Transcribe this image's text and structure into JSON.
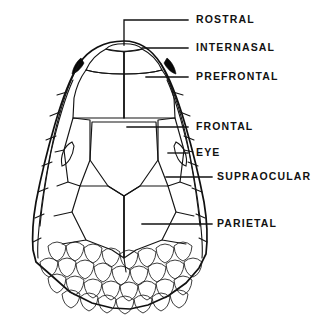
{
  "figure": {
    "name": "snake-head-dorsal-scalation-diagram",
    "background_color": "#ffffff",
    "ink_color": "#121212",
    "view": "dorsal"
  },
  "labels": [
    {
      "id": "rostral",
      "text": "ROSTRAL",
      "text_x": 196,
      "text_y": 20,
      "leader": "M 188 20 L 124 20 L 124 45",
      "points_to": "snout tip shield"
    },
    {
      "id": "internasal",
      "text": "INTERNASAL",
      "text_x": 196,
      "text_y": 48,
      "leader": "M 188 48 L 142 48",
      "points_to": "paired shields behind rostral"
    },
    {
      "id": "prefrontal",
      "text": "PREFRONTAL",
      "text_x": 196,
      "text_y": 77,
      "leader": "M 188 77 L 146 77",
      "points_to": "paired shields behind internasals"
    },
    {
      "id": "frontal",
      "text": "FRONTAL",
      "text_x": 196,
      "text_y": 127,
      "leader": "M 188 127 L 127 127",
      "points_to": "large median shield on crown"
    },
    {
      "id": "eye",
      "text": "EYE",
      "text_x": 196,
      "text_y": 153,
      "leader": "M 188 153 L 168 153",
      "points_to": "orbit on side of head"
    },
    {
      "id": "supraocular",
      "text": "SUPRAOCULAR",
      "text_x": 217,
      "text_y": 177,
      "leader": "M 212 177 L 166 177",
      "points_to": "shield above the eye"
    },
    {
      "id": "parietal",
      "text": "PARIETAL",
      "text_x": 217,
      "text_y": 224,
      "leader": "M 212 224 L 142 224",
      "points_to": "large paired shields at rear of crown"
    }
  ],
  "scales": {
    "named_shields": [
      "ROSTRAL",
      "INTERNASAL",
      "PREFRONTAL",
      "FRONTAL",
      "SUPRAOCULAR",
      "PARIETAL"
    ],
    "other_features": [
      "EYE"
    ],
    "body_scale_rows": 4,
    "stippled": true
  }
}
